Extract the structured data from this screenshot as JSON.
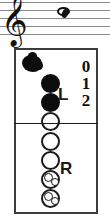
{
  "notation": {
    "clef": "treble-clef",
    "clef_glyph": "𝄞",
    "note": {
      "type": "whole-note",
      "pitch": "E",
      "staff_position": "top-space"
    },
    "staff_lines": 5,
    "line_color": "#8a8a8a",
    "ink_color": "#111111"
  },
  "chart": {
    "instrument": "recorder",
    "border_color": "#3c3c3c",
    "hand_labels": {
      "left": "L",
      "right": "R"
    },
    "finger_numbers": [
      "0",
      "1",
      "2"
    ],
    "thumb": {
      "name": "thumb-hole",
      "state": "closed"
    },
    "holes": [
      {
        "index": 1,
        "state": "closed",
        "hand": "left",
        "type": "single"
      },
      {
        "index": 2,
        "state": "closed",
        "hand": "left",
        "type": "single"
      },
      {
        "index": 3,
        "state": "open",
        "hand": "left",
        "type": "single"
      },
      {
        "index": 4,
        "state": "open",
        "hand": "right",
        "type": "single"
      },
      {
        "index": 5,
        "state": "open",
        "hand": "right",
        "type": "single"
      },
      {
        "index": 6,
        "state": "open",
        "hand": "right",
        "type": "double"
      },
      {
        "index": 7,
        "state": "open",
        "hand": "right",
        "type": "double"
      }
    ]
  }
}
